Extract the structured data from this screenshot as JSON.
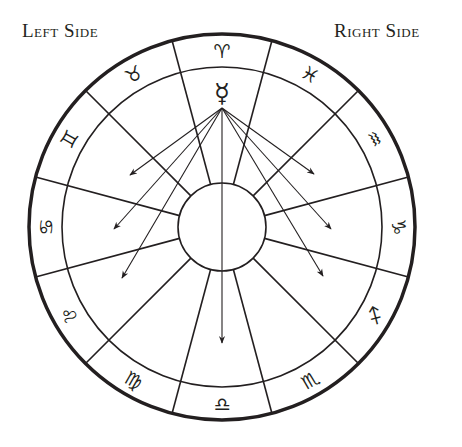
{
  "labels": {
    "left": "Left Side",
    "right": "Right Side"
  },
  "chart": {
    "center": [
      222,
      227
    ],
    "outer_radius": 193,
    "ring_radius": 160,
    "inner_radius": 44,
    "line_color": "#231f20",
    "planet": {
      "name": "Mercury",
      "glyph": "☿",
      "position": [
        222,
        93
      ]
    },
    "arrow_origin": [
      222,
      108
    ],
    "arrow_targets": [
      [
        130,
        175
      ],
      [
        114,
        229
      ],
      [
        122,
        278
      ],
      [
        222,
        343
      ],
      [
        314,
        174
      ],
      [
        331,
        229
      ],
      [
        323,
        276
      ]
    ],
    "signs": [
      {
        "name": "Aries",
        "glyph": "♈",
        "angle": 0
      },
      {
        "name": "Pisces",
        "glyph": "♓",
        "angle": 30
      },
      {
        "name": "Aquarius",
        "glyph": "♒",
        "angle": 60
      },
      {
        "name": "Capricorn",
        "glyph": "♑",
        "angle": 90
      },
      {
        "name": "Sagittarius",
        "glyph": "♐",
        "angle": 120
      },
      {
        "name": "Scorpio",
        "glyph": "♏",
        "angle": 150
      },
      {
        "name": "Libra",
        "glyph": "♎",
        "angle": 180
      },
      {
        "name": "Virgo",
        "glyph": "♍",
        "angle": 210
      },
      {
        "name": "Leo",
        "glyph": "♌",
        "angle": 240
      },
      {
        "name": "Cancer",
        "glyph": "♋",
        "angle": 270
      },
      {
        "name": "Gemini",
        "glyph": "♊",
        "angle": 300
      },
      {
        "name": "Taurus",
        "glyph": "♉",
        "angle": 330
      }
    ]
  }
}
